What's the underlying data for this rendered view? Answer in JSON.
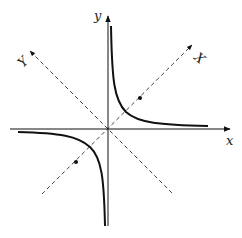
{
  "figure": {
    "axes": {
      "x_label": "x",
      "y_label": "y",
      "rotated_X_label": "X",
      "rotated_Y_label": "Y"
    },
    "colors": {
      "stroke": "#111111",
      "background": "#ffffff"
    }
  }
}
